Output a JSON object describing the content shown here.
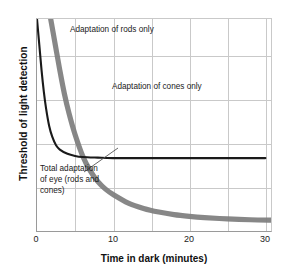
{
  "chart_data": {
    "type": "line",
    "title": "",
    "xlabel": "Time in dark (minutes)",
    "ylabel": "Threshold of light detection",
    "xlim": [
      0,
      31
    ],
    "ylim": [
      0,
      100
    ],
    "xticks": [
      "0",
      "10",
      "20",
      "30"
    ],
    "xtick_values": [
      0,
      10,
      20,
      30
    ],
    "grid": true,
    "grid_x_minor_step": 5,
    "grid_y_lines": 4,
    "yticks": [],
    "legend": "none",
    "series": [
      {
        "name": "Adaptation of cones only",
        "color": "#1a1a1a",
        "width": "thin",
        "x": [
          0.0,
          0.3,
          0.6,
          0.9,
          1.2,
          1.6,
          2.0,
          2.5,
          3.0,
          4.0,
          5.0,
          6.0,
          8.0,
          10.0,
          14.0,
          18.0,
          22.0,
          26.0,
          30.0
        ],
        "y": [
          100,
          88,
          76,
          66,
          58,
          50,
          45,
          41,
          39,
          37,
          36,
          35.5,
          35.2,
          35,
          35,
          35,
          35,
          35,
          35
        ]
      },
      {
        "name": "Total adaptation of eye (rods and cones)",
        "color": "#7d7d7d",
        "width": "thick",
        "x": [
          1.8,
          2.4,
          3.0,
          3.6,
          4.2,
          5.0,
          6.0,
          7.0,
          8.0,
          9.0,
          10.0,
          12.0,
          14.0,
          16.0,
          18.0,
          20.0,
          22.0,
          25.0,
          28.0,
          31.0
        ],
        "y": [
          100,
          88,
          76,
          65,
          56,
          46,
          36,
          29,
          24,
          20.5,
          18,
          14,
          11.5,
          9.8,
          8.6,
          7.8,
          7.2,
          6.6,
          6.2,
          6.0
        ]
      }
    ],
    "annotations": [
      {
        "name": "rods-label",
        "text": "Adaptation of rods only"
      },
      {
        "name": "cones-label",
        "text": "Adaptation of cones only"
      },
      {
        "name": "total-label",
        "line1": "Total adaptation",
        "line2": "of eye (rods and",
        "line3": "cones)",
        "has_leader_line": true
      }
    ]
  },
  "axis": {
    "x_title": "Time in dark (minutes)",
    "y_title": "Threshold of light detection",
    "x_tick_0": "0",
    "x_tick_1": "10",
    "x_tick_2": "20",
    "x_tick_3": "30"
  },
  "labels": {
    "rods": "Adaptation of rods only",
    "cones": "Adaptation of cones only",
    "total_line1": "Total adaptation",
    "total_line2": "of eye (rods and",
    "total_line3": "cones)"
  },
  "colors": {
    "cones_curve": "#1a1a1a",
    "total_curve": "#7d7d7d",
    "grid": "#c9c9c9",
    "axis": "#9a9a9a",
    "background": "#ffffff"
  }
}
